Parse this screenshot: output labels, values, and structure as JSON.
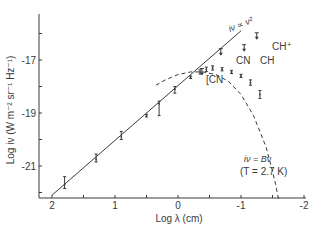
{
  "chart_data": {
    "type": "scatter",
    "title": "",
    "xlabel": "Log λ (cm)",
    "ylabel": "Log iν (W m⁻² sr⁻¹ Hz⁻¹)",
    "xlim": [
      2.2,
      -2.05
    ],
    "ylim": [
      -22.3,
      -15.4
    ],
    "x_reversed": true,
    "grid": false,
    "x_ticks": [
      2,
      1.5,
      1,
      0.5,
      0,
      -0.5,
      -1,
      -1.5,
      -2
    ],
    "x_tick_labels": [
      "2",
      "",
      "1",
      "",
      "0",
      "",
      "-1",
      "",
      "-2"
    ],
    "y_ticks": [
      -16,
      -17,
      -18,
      -19,
      -20,
      -21,
      -22
    ],
    "y_tick_labels": [
      "",
      "-17",
      "",
      "-19",
      "",
      "-21",
      ""
    ],
    "series": [
      {
        "name": "Rayleigh-Jeans line",
        "label": "iν ∝ ν²",
        "style": "solid",
        "x": [
          2.0,
          -1.0
        ],
        "y": [
          -22.1,
          -15.9
        ]
      },
      {
        "name": "Blackbody curve",
        "label": "iν = Bν (T = 2.7 K)",
        "style": "dashed",
        "x": [
          0.35,
          0.2,
          0.0,
          -0.2,
          -0.4,
          -0.6,
          -0.8,
          -1.0,
          -1.2,
          -1.4,
          -1.5,
          -1.55,
          -1.6
        ],
        "y": [
          -17.95,
          -17.75,
          -17.55,
          -17.45,
          -17.45,
          -17.55,
          -17.8,
          -18.3,
          -19.1,
          -20.3,
          -21.2,
          -21.7,
          -22.3
        ]
      },
      {
        "name": "Measurements",
        "style": "error-bar",
        "points": [
          {
            "x": 1.8,
            "y": -21.7,
            "err_low": 0.15,
            "err_high": 0.3
          },
          {
            "x": 1.3,
            "y": -20.75,
            "err_low": 0.1,
            "err_high": 0.2
          },
          {
            "x": 0.9,
            "y": -19.9,
            "err_low": 0.1,
            "err_high": 0.2
          },
          {
            "x": 0.5,
            "y": -19.1,
            "err_low": 0.05,
            "err_high": 0.05
          },
          {
            "x": 0.3,
            "y": -18.65,
            "err_low": 0.45,
            "err_high": 0.1
          },
          {
            "x": 0.05,
            "y": -18.1,
            "err_low": 0.15,
            "err_high": 0.1
          },
          {
            "x": -0.2,
            "y": -17.65,
            "err_low": 0.05,
            "err_high": 0.05
          },
          {
            "x": -0.35,
            "y": -17.45,
            "err_low": 0.08,
            "err_high": 0.08
          },
          {
            "x": -0.45,
            "y": -17.35,
            "err_low": 0.08,
            "err_high": 0.08
          },
          {
            "x": -0.55,
            "y": -17.3,
            "err_low": 0.08,
            "err_high": 0.08
          },
          {
            "x": -0.7,
            "y": -17.35,
            "err_low": 0.06,
            "err_high": 0.06
          },
          {
            "x": -0.85,
            "y": -17.45,
            "err_low": 0.06,
            "err_high": 0.06
          },
          {
            "x": -1.0,
            "y": -17.6,
            "err_low": 0.06,
            "err_high": 0.06
          },
          {
            "x": -1.15,
            "y": -17.85,
            "err_low": 0.1,
            "err_high": 0.1
          },
          {
            "x": -1.3,
            "y": -18.3,
            "err_low": 0.15,
            "err_high": 0.15
          }
        ]
      },
      {
        "name": "Upper limits (interstellar molecules)",
        "style": "arrow-down",
        "points": [
          {
            "x": -0.38,
            "y": -17.55,
            "label": "CN",
            "bracket": true
          },
          {
            "x": -0.68,
            "y": -16.8,
            "label": "CN"
          },
          {
            "x": -1.05,
            "y": -16.65,
            "label": "CH"
          },
          {
            "x": -1.25,
            "y": -16.2,
            "label": "CH⁺"
          }
        ]
      }
    ],
    "annotations": [
      {
        "text": "iν ∝ ν²",
        "x": -0.55,
        "y": -16.1
      },
      {
        "text": "iν = Bν",
        "x": -0.95,
        "y": -20.6
      },
      {
        "text": "(T = 2.7 K)",
        "x": -0.95,
        "y": -21.0
      }
    ]
  },
  "labels": {
    "x_axis_title": "Log λ (cm)",
    "y_axis_title": "Log iν  (W m⁻² sr⁻¹ Hz⁻¹)",
    "x_ticks": [
      "2",
      "1",
      "0",
      "-1",
      "-2"
    ],
    "y_ticks": [
      "-17",
      "-19",
      "-21"
    ],
    "rj_label": "iν ∝ ν²",
    "bb_label_1": "iν = Bν",
    "bb_label_2": "(T = 2.7 K)",
    "cn_bracket": "[CN",
    "cn": "CN",
    "ch": "CH",
    "chplus": "CH⁺"
  },
  "colors": {
    "ink": "#3a3a3a",
    "background": "#ffffff"
  }
}
